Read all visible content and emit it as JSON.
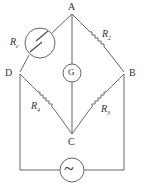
{
  "diagram": {
    "nodes": {
      "A": "A",
      "B": "B",
      "C": "C",
      "D": "D"
    },
    "components": {
      "rc": {
        "label": "R",
        "sub": "c"
      },
      "r2": {
        "label": "R",
        "sub": "2"
      },
      "r3": {
        "label": "R",
        "sub": "3"
      },
      "r4": {
        "label": "R",
        "sub": "4"
      },
      "galvanometer": "G",
      "source": "~"
    },
    "colors": {
      "line": "#555555",
      "text": "#333333"
    }
  }
}
